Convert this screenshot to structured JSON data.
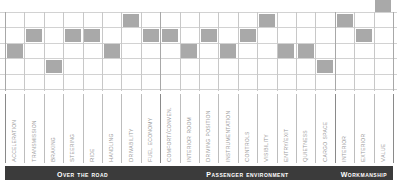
{
  "chart_data": {
    "type": "scatter",
    "title": "",
    "subtitle": "",
    "xlabel": "",
    "ylabel": "",
    "grid": true,
    "legend_position": "none",
    "rows": 5,
    "row_note": "marker row index 0 = highest level, 4 = lowest level",
    "categories": [
      "Acceleration",
      "Transmission",
      "Braking",
      "Steering",
      "Ride",
      "Handling",
      "Drivability",
      "Fuel Economy",
      "Comfort/Conven.",
      "Interior Room",
      "Driving Position",
      "Instrumentation",
      "Controls",
      "Visibility",
      "Entry/Exit",
      "Quietness",
      "Cargo Space",
      "Interior",
      "Exterior",
      "Value"
    ],
    "values": [
      2,
      1,
      3,
      1,
      1,
      2,
      0,
      1,
      1,
      2,
      1,
      2,
      1,
      0,
      2,
      2,
      3,
      0,
      1,
      -1
    ],
    "marker_color": "#a9a9a9",
    "gridline_color": "#d2d2d2",
    "separator_color": "#a8a8a8",
    "band_color": "#3b3b3b",
    "band_text_color": "#ffffff"
  },
  "groups": [
    {
      "label": "Over The Road",
      "start": 0,
      "end": 7
    },
    {
      "label": "Passenger Environment",
      "start": 8,
      "end": 16
    },
    {
      "label": "Workmanship",
      "start": 17,
      "end": 19
    }
  ]
}
